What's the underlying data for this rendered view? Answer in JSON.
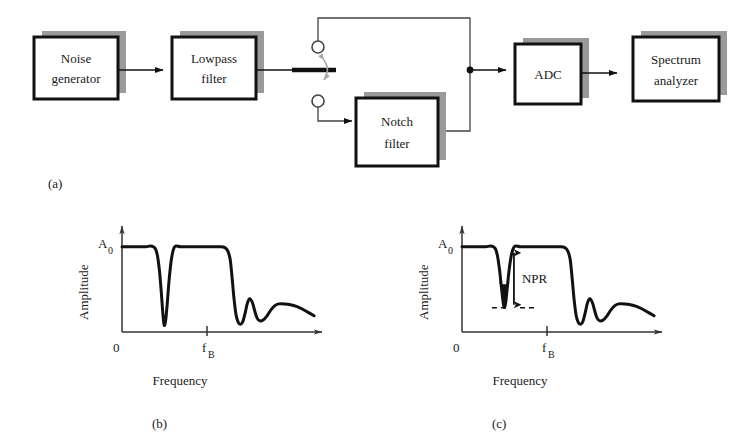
{
  "figure": {
    "background": "#ffffff",
    "ink": "#111111",
    "shadow_color": "#9a9a9a"
  },
  "panels": [
    {
      "id": "a",
      "caption": "(a)"
    },
    {
      "id": "b",
      "caption": "(b)"
    },
    {
      "id": "c",
      "caption": "(c)"
    }
  ],
  "block_diagram": {
    "blocks": [
      {
        "id": "noise-generator",
        "line1": "Noise",
        "line2": "generator"
      },
      {
        "id": "lowpass-filter",
        "line1": "Lowpass",
        "line2": "filter"
      },
      {
        "id": "notch-filter",
        "line1": "Notch",
        "line2": "filter"
      },
      {
        "id": "adc",
        "line1": "ADC",
        "line2": ""
      },
      {
        "id": "spectrum-analyzer",
        "line1": "Spectrum",
        "line2": "analyzer"
      }
    ],
    "switch": {
      "name": "toggle-switch",
      "positions": [
        "bypass",
        "notch"
      ],
      "terminals": 2
    }
  },
  "plots": {
    "b": {
      "caption": "(b)",
      "ylabel": "Amplitude",
      "xlabel": "Frequency",
      "y_top_label": "A",
      "y_top_sub": "0",
      "x_origin_label": "0",
      "x_tick_label": "f",
      "x_tick_sub": "B",
      "notch_filled": false,
      "annotation": null
    },
    "c": {
      "caption": "(c)",
      "ylabel": "Amplitude",
      "xlabel": "Frequency",
      "y_top_label": "A",
      "y_top_sub": "0",
      "x_origin_label": "0",
      "x_tick_label": "f",
      "x_tick_sub": "B",
      "notch_filled": true,
      "annotation": "NPR"
    }
  },
  "chart_data": [
    {
      "id": "b",
      "type": "line",
      "title": "",
      "xlabel": "Frequency",
      "ylabel": "Amplitude",
      "xlim": [
        0,
        1.0
      ],
      "ylim": [
        0,
        1.08
      ],
      "grid": false,
      "legend": null,
      "xtick_labels": [
        "0",
        "fB"
      ],
      "xtick_values": [
        0.0,
        0.56
      ],
      "ytick_labels": [
        "A0"
      ],
      "ytick_values": [
        1.0
      ],
      "notch_depth": 0.06,
      "notch_center": 0.215,
      "x": [
        0.0,
        0.03,
        0.06,
        0.09,
        0.12,
        0.145,
        0.16,
        0.172,
        0.182,
        0.192,
        0.2,
        0.207,
        0.212,
        0.215,
        0.219,
        0.224,
        0.231,
        0.24,
        0.25,
        0.258,
        0.266,
        0.275,
        0.3,
        0.34,
        0.38,
        0.42,
        0.46,
        0.5,
        0.525,
        0.54,
        0.552,
        0.562,
        0.572,
        0.582,
        0.592,
        0.604,
        0.616,
        0.628,
        0.64,
        0.652,
        0.666,
        0.678,
        0.69,
        0.704,
        0.72,
        0.74,
        0.76,
        0.78,
        0.8,
        0.83,
        0.86,
        0.89,
        0.92,
        0.95,
        0.98
      ],
      "y": [
        1.0,
        1.0,
        1.0,
        1.0,
        1.0,
        1.01,
        1.0,
        0.97,
        0.88,
        0.7,
        0.48,
        0.26,
        0.13,
        0.08,
        0.09,
        0.16,
        0.34,
        0.6,
        0.82,
        0.93,
        0.99,
        1.01,
        1.0,
        1.0,
        1.0,
        1.0,
        1.0,
        1.0,
        0.99,
        0.95,
        0.85,
        0.63,
        0.38,
        0.2,
        0.12,
        0.09,
        0.12,
        0.22,
        0.34,
        0.39,
        0.34,
        0.24,
        0.16,
        0.13,
        0.14,
        0.19,
        0.26,
        0.31,
        0.33,
        0.33,
        0.32,
        0.3,
        0.27,
        0.23,
        0.19
      ]
    },
    {
      "id": "c",
      "type": "line",
      "title": "",
      "xlabel": "Frequency",
      "ylabel": "Amplitude",
      "xlim": [
        0,
        1.0
      ],
      "ylim": [
        0,
        1.08
      ],
      "grid": false,
      "legend": null,
      "xtick_labels": [
        "0",
        "fB"
      ],
      "xtick_values": [
        0.0,
        0.56
      ],
      "ytick_labels": [
        "A0"
      ],
      "ytick_values": [
        1.0
      ],
      "notch_depth": 0.26,
      "notch_center": 0.215,
      "npr_top": 1.0,
      "npr_bottom": 0.32,
      "npr_label": "NPR",
      "x": [
        0.0,
        0.03,
        0.06,
        0.09,
        0.12,
        0.145,
        0.16,
        0.172,
        0.182,
        0.192,
        0.2,
        0.207,
        0.212,
        0.215,
        0.219,
        0.224,
        0.231,
        0.24,
        0.25,
        0.258,
        0.266,
        0.275,
        0.3,
        0.34,
        0.38,
        0.42,
        0.46,
        0.5,
        0.525,
        0.54,
        0.552,
        0.562,
        0.572,
        0.582,
        0.592,
        0.604,
        0.616,
        0.628,
        0.64,
        0.652,
        0.666,
        0.678,
        0.69,
        0.704,
        0.72,
        0.74,
        0.76,
        0.78,
        0.8,
        0.83,
        0.86,
        0.89,
        0.92,
        0.95,
        0.98
      ],
      "y": [
        1.0,
        1.0,
        1.0,
        1.0,
        1.0,
        1.01,
        1.0,
        0.97,
        0.88,
        0.72,
        0.55,
        0.4,
        0.32,
        0.29,
        0.3,
        0.36,
        0.52,
        0.72,
        0.88,
        0.96,
        1.0,
        1.01,
        1.0,
        1.0,
        1.0,
        1.0,
        1.0,
        1.0,
        0.99,
        0.95,
        0.85,
        0.63,
        0.38,
        0.2,
        0.12,
        0.09,
        0.12,
        0.22,
        0.34,
        0.39,
        0.34,
        0.24,
        0.16,
        0.13,
        0.14,
        0.19,
        0.26,
        0.31,
        0.33,
        0.33,
        0.32,
        0.3,
        0.27,
        0.23,
        0.19
      ]
    }
  ]
}
